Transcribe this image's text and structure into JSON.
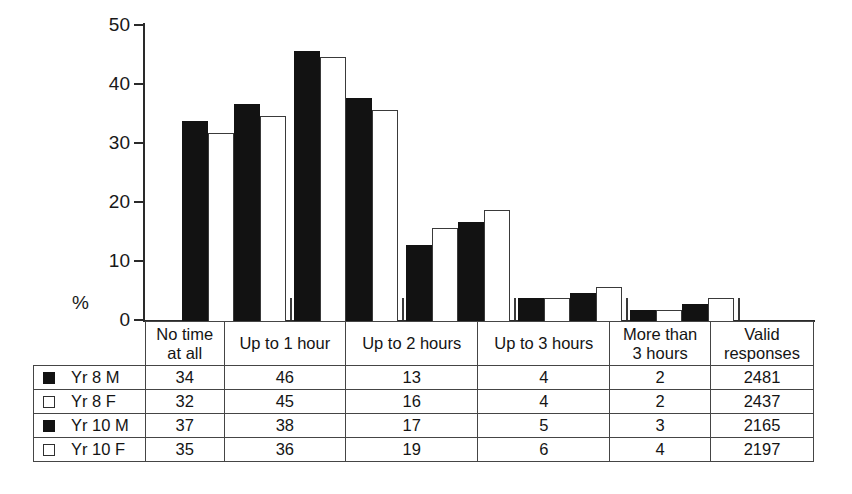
{
  "chart_data": {
    "type": "bar",
    "title": "",
    "subtitle": "",
    "xlabel": "",
    "ylabel": "%",
    "ylim": [
      0,
      50
    ],
    "ytick_values": [
      0,
      10,
      20,
      30,
      40,
      50
    ],
    "ytick_labels": [
      "0",
      "10",
      "20",
      "30",
      "40",
      "50"
    ],
    "grid": false,
    "legend_position": "table-left-column",
    "categories": [
      "No time at all",
      "Up to 1 hour",
      "Up to 2 hours",
      "Up to 3 hours",
      "More than 3 hours"
    ],
    "series": [
      {
        "name": "Yr 8 M",
        "marker": "filled-square",
        "values": [
          34,
          46,
          13,
          4,
          2
        ],
        "valid_responses": 2481
      },
      {
        "name": "Yr 8 F",
        "marker": "open-square",
        "values": [
          32,
          45,
          16,
          4,
          2
        ],
        "valid_responses": 2437
      },
      {
        "name": "Yr 10 M",
        "marker": "filled-square",
        "values": [
          37,
          38,
          17,
          5,
          3
        ],
        "valid_responses": 2165
      },
      {
        "name": "Yr 10 F",
        "marker": "open-square",
        "values": [
          35,
          36,
          19,
          6,
          4
        ],
        "valid_responses": 2197
      }
    ],
    "annotations": []
  },
  "axis": {
    "y_label": "%",
    "ticks": [
      {
        "value": 50,
        "label": "50"
      },
      {
        "value": 40,
        "label": "40"
      },
      {
        "value": 30,
        "label": "30"
      },
      {
        "value": 20,
        "label": "20"
      },
      {
        "value": 10,
        "label": "10"
      },
      {
        "value": 0,
        "label": "0"
      }
    ]
  },
  "table": {
    "legend_header": "",
    "column_headers": [
      {
        "line1": "No time",
        "line2": "at all"
      },
      {
        "line1": "Up to 1 hour",
        "line2": ""
      },
      {
        "line1": "Up to 2 hours",
        "line2": ""
      },
      {
        "line1": "Up to 3 hours",
        "line2": ""
      },
      {
        "line1": "More than",
        "line2": "3 hours"
      },
      {
        "line1": "Valid",
        "line2": "responses"
      }
    ],
    "rows": [
      {
        "label": "Yr 8 M",
        "marker": "filled-square",
        "cells": [
          "34",
          "46",
          "13",
          "4",
          "2",
          "2481"
        ]
      },
      {
        "label": "Yr 8 F",
        "marker": "open-square",
        "cells": [
          "32",
          "45",
          "16",
          "4",
          "2",
          "2437"
        ]
      },
      {
        "label": "Yr 10 M",
        "marker": "filled-square",
        "cells": [
          "37",
          "38",
          "17",
          "5",
          "3",
          "2165"
        ]
      },
      {
        "label": "Yr 10 F",
        "marker": "open-square",
        "cells": [
          "35",
          "36",
          "19",
          "6",
          "4",
          "2197"
        ]
      }
    ]
  },
  "colors": {
    "series_filled": "#121212",
    "series_open": "#ffffff",
    "open_outline": "#3a3a3a",
    "axis": "#2a2a2a",
    "table_border": "#454545",
    "text": "#141414",
    "background": "#ffffff"
  }
}
